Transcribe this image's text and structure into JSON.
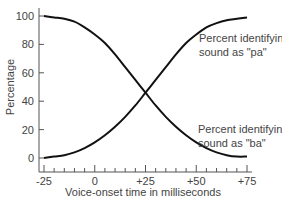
{
  "chart_data": {
    "type": "line",
    "title": "",
    "xlabel": "Voice-onset time in milliseconds",
    "ylabel": "Percentage",
    "xlim": [
      -25,
      75
    ],
    "ylim": [
      0,
      100
    ],
    "x_ticks": [
      "-25",
      "0",
      "+25",
      "+50",
      "+75"
    ],
    "x_tick_values": [
      -25,
      0,
      25,
      50,
      75
    ],
    "x_minor_tick_step": 5,
    "y_ticks": [
      "0",
      "20",
      "40",
      "60",
      "80",
      "100"
    ],
    "y_tick_values": [
      0,
      20,
      40,
      60,
      80,
      100
    ],
    "grid": false,
    "legend": "inline annotations at right",
    "x": [
      -25,
      -20,
      -15,
      -10,
      -5,
      0,
      5,
      10,
      15,
      20,
      25,
      30,
      35,
      40,
      45,
      50,
      55,
      60,
      65,
      70,
      75
    ],
    "series": [
      {
        "name": "Percent identifying sound as \"ba\"",
        "label_lines": [
          "Percent identifying",
          "sound as \"ba\""
        ],
        "values": [
          100,
          99,
          98,
          96,
          92,
          87,
          81,
          73,
          64,
          55,
          46,
          37,
          29,
          22,
          16,
          11,
          7,
          4,
          2,
          1,
          1
        ]
      },
      {
        "name": "Percent identifying sound as \"pa\"",
        "label_lines": [
          "Percent identifying",
          "sound as \"pa\""
        ],
        "values": [
          0,
          1,
          2,
          4,
          7,
          11,
          16,
          22,
          29,
          37,
          46,
          55,
          64,
          73,
          81,
          87,
          92,
          95,
          97,
          98,
          99
        ]
      }
    ],
    "annotations": [
      {
        "text": "Percent identifying sound as \"pa\"",
        "near": "upper right, beside rising curve end"
      },
      {
        "text": "Percent identifying sound as \"ba\"",
        "near": "lower right, beside falling curve end"
      }
    ],
    "colors": {
      "line": "#111111",
      "axis": "#555555",
      "text": "#444444"
    }
  }
}
